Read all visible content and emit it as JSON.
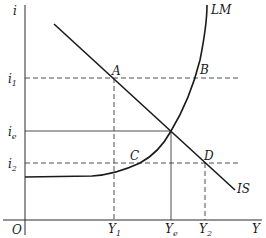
{
  "diagram": {
    "axes": {
      "y_label": "i",
      "x_label": "Y",
      "origin_label": "O"
    },
    "curves": {
      "is_label": "IS",
      "lm_label": "LM"
    },
    "interest_rates": {
      "i1": {
        "base": "i",
        "sub": "1"
      },
      "ie": {
        "base": "i",
        "sub": "e"
      },
      "i2": {
        "base": "i",
        "sub": "2"
      }
    },
    "incomes": {
      "Y1": {
        "base": "Y",
        "sub": "1"
      },
      "Ye": {
        "base": "Y",
        "sub": "e"
      },
      "Y2": {
        "base": "Y",
        "sub": "2"
      }
    },
    "points": {
      "A": "A",
      "B": "B",
      "C": "C",
      "D": "D"
    },
    "colors": {
      "line": "#1a1a1a",
      "background": "#ffffff"
    }
  }
}
